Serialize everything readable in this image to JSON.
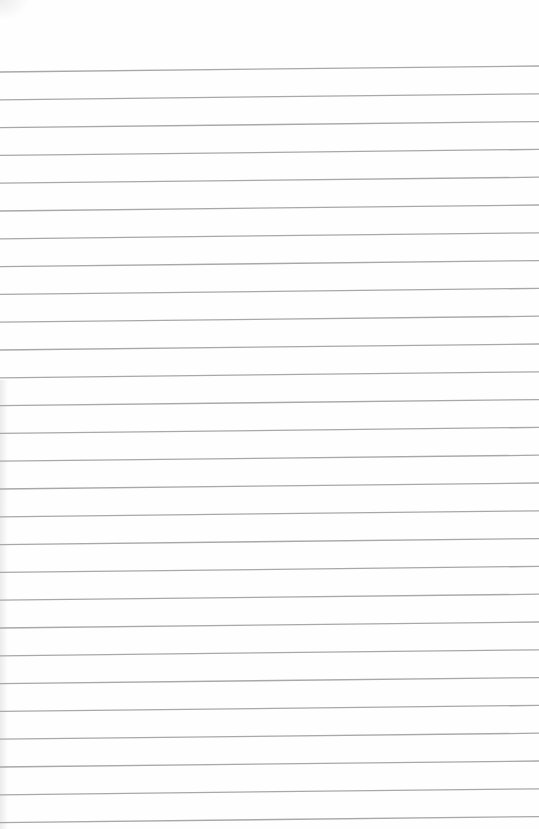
{
  "paper": {
    "type": "lined-paper",
    "background_color": "#fefefe",
    "line_color": "#a8a8a8",
    "line_count": 28,
    "first_line_left_y": 72,
    "first_line_right_y": 66,
    "line_spacing": 27.8,
    "line_width": 1.3
  }
}
